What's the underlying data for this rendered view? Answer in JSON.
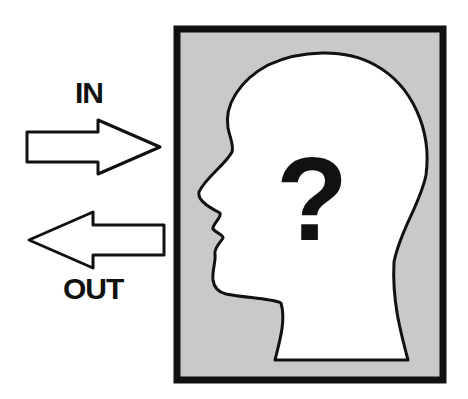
{
  "labels": {
    "in": "IN",
    "out": "OUT",
    "question": "?"
  },
  "icons": {
    "in_arrow": "right-arrow-icon",
    "out_arrow": "left-arrow-icon",
    "head": "head-profile-icon"
  },
  "colors": {
    "frame_fill": "#c8c8c8",
    "frame_border": "#111111",
    "head_fill": "#ffffff",
    "stroke": "#111111"
  }
}
